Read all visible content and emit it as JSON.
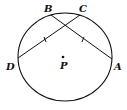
{
  "diagram": {
    "type": "circle-chords",
    "points": {
      "B": {
        "label": "B",
        "x": 51,
        "y": 14
      },
      "C": {
        "label": "C",
        "x": 79,
        "y": 14
      },
      "D": {
        "label": "D",
        "x": 18,
        "y": 58
      },
      "A": {
        "label": "A",
        "x": 112,
        "y": 58
      },
      "P": {
        "label": "P",
        "x": 63,
        "y": 57
      }
    },
    "chords": [
      "BA",
      "CD"
    ],
    "congruence_marks": "single tick on chord CD and chord BA",
    "stroke_color": "#111111"
  }
}
